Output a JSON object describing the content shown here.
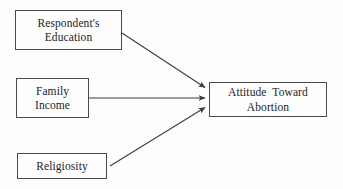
{
  "diagram": {
    "type": "path-diagram",
    "title": "",
    "line_color": "#3f3f3f",
    "box_border_color": "#4a4a4a",
    "background_color": "#fdfdfd",
    "text_color": "#1c1c1c",
    "nodes": [
      {
        "id": "education",
        "label": "Respondent's\nEducation",
        "role": "predictor",
        "x": 15,
        "y": 10,
        "w": 107,
        "h": 40
      },
      {
        "id": "income",
        "label": "Family\nIncome",
        "role": "predictor",
        "x": 16,
        "y": 78,
        "w": 73,
        "h": 40
      },
      {
        "id": "religiosity",
        "label": "Religiosity",
        "role": "predictor",
        "x": 17,
        "y": 153,
        "w": 90,
        "h": 26
      },
      {
        "id": "outcome",
        "label": "Attitude  Toward\nAbortion",
        "role": "outcome",
        "x": 209,
        "y": 82,
        "w": 118,
        "h": 35
      }
    ],
    "edges": [
      {
        "id": "education-to-outcome",
        "from": "education",
        "to": "outcome",
        "label": "",
        "arrowhead": true,
        "x1": 122,
        "y1": 33,
        "x2": 206,
        "y2": 88
      },
      {
        "id": "income-to-outcome",
        "from": "income",
        "to": "outcome",
        "label": "",
        "arrowhead": true,
        "x1": 89,
        "y1": 98,
        "x2": 206,
        "y2": 98
      },
      {
        "id": "religiosity-to-outcome",
        "from": "religiosity",
        "to": "outcome",
        "label": "",
        "arrowhead": true,
        "x1": 110,
        "y1": 166,
        "x2": 206,
        "y2": 107
      }
    ]
  }
}
